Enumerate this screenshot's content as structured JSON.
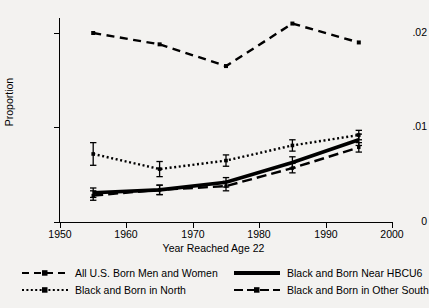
{
  "chart_data": {
    "type": "line",
    "title": "",
    "xlabel": "Year Reached Age 22",
    "ylabel": "Proportion",
    "xlim": [
      1950,
      2000
    ],
    "ylim": [
      0,
      0.022
    ],
    "xticks": [
      1950,
      1960,
      1970,
      1980,
      1990,
      2000
    ],
    "xtick_labels": [
      "1950",
      "1960",
      "1970",
      "1980",
      "1990",
      "2000"
    ],
    "yticks": [
      0,
      0.01,
      0.02
    ],
    "ytick_labels": [
      "0",
      ".01",
      ".02"
    ],
    "grid": false,
    "legend_position": "below",
    "x": [
      1955,
      1965,
      1975,
      1985,
      1995
    ],
    "series": [
      {
        "name": "All U.S. Born Men and Women",
        "style": "long-dash",
        "values": [
          0.02,
          0.0188,
          0.0165,
          0.021,
          0.019
        ],
        "errors": [
          0,
          0,
          0,
          0,
          0
        ]
      },
      {
        "name": "Black and Born in North",
        "style": "dotted",
        "values": [
          0.0072,
          0.0056,
          0.0065,
          0.0081,
          0.0092
        ],
        "errors": [
          0.0012,
          0.0008,
          0.0006,
          0.0006,
          0.0005
        ]
      },
      {
        "name": "Black and Born Near HBCU6",
        "style": "solid-thick",
        "values": [
          0.0031,
          0.0034,
          0.0042,
          0.0063,
          0.0087
        ],
        "errors": [
          0.0005,
          0.0005,
          0.0005,
          0.0006,
          0.0006
        ]
      },
      {
        "name": "Black and Born in Other South",
        "style": "dash",
        "values": [
          0.0028,
          0.0034,
          0.0038,
          0.0057,
          0.0079
        ],
        "errors": [
          0.0005,
          0.0005,
          0.0005,
          0.0005,
          0.0005
        ]
      }
    ]
  },
  "axes": {
    "ylabel": "Proportion",
    "xlabel": "Year Reached Age 22",
    "ytick_0": "0",
    "ytick_1": ".01",
    "ytick_2": ".02",
    "xtick_0": "1950",
    "xtick_1": "1960",
    "xtick_2": "1970",
    "xtick_3": "1980",
    "xtick_4": "1990",
    "xtick_5": "2000"
  },
  "legend": {
    "items": [
      {
        "label": "All U.S. Born Men and Women",
        "key": "long-dash-key"
      },
      {
        "label": "Black and Born Near HBCU6",
        "key": "solid-thick-key"
      },
      {
        "label": "Black and Born in North",
        "key": "dotted-key"
      },
      {
        "label": "Black and Born in Other South",
        "key": "dash-key"
      }
    ]
  },
  "colors": {
    "line": "#000000",
    "background": "#f3f2f0",
    "axis": "#000000"
  }
}
